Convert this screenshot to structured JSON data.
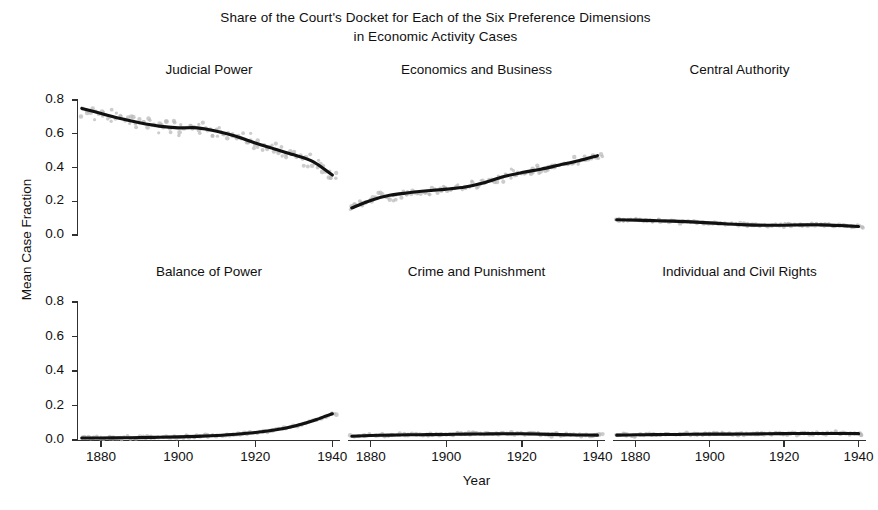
{
  "figure": {
    "title": "Share of the Court's Docket for Each of the Six Preference Dimensions\nin Economic Activity Cases",
    "xlabel": "Year",
    "ylabel": "Mean Case Fraction"
  },
  "chart_data": {
    "type": "line",
    "title": "Share of the Court's Docket for Each of the Six Preference Dimensions in Economic Activity Cases",
    "xlabel": "Year",
    "ylabel": "Mean Case Fraction",
    "grid": false,
    "legend": "none",
    "layout": "3 columns x 2 rows of small-multiple panels, shared axes",
    "xlim": [
      1874,
      1942
    ],
    "ylim": [
      0.0,
      0.88
    ],
    "xticks": [
      1880,
      1900,
      1920,
      1940
    ],
    "xtick_labels": [
      "1880",
      "1900",
      "1920",
      "1940"
    ],
    "yticks": [
      0.0,
      0.2,
      0.4,
      0.6,
      0.8
    ],
    "ytick_labels": [
      "0.0",
      "0.2",
      "0.4",
      "0.6",
      "0.8"
    ],
    "marker_style": "light grey scatter of yearly observations with heavy black smoothed trend line",
    "panels": [
      {
        "name": "Judicial Power",
        "row": 0,
        "col": 0,
        "x": [
          1875,
          1880,
          1885,
          1890,
          1895,
          1900,
          1905,
          1910,
          1915,
          1920,
          1925,
          1930,
          1935,
          1940
        ],
        "values": [
          0.75,
          0.72,
          0.69,
          0.665,
          0.645,
          0.635,
          0.635,
          0.615,
          0.585,
          0.545,
          0.51,
          0.475,
          0.435,
          0.355
        ]
      },
      {
        "name": "Economics and Business",
        "row": 0,
        "col": 1,
        "x": [
          1875,
          1880,
          1885,
          1890,
          1895,
          1900,
          1905,
          1910,
          1915,
          1920,
          1925,
          1930,
          1935,
          1940
        ],
        "values": [
          0.16,
          0.205,
          0.235,
          0.25,
          0.262,
          0.272,
          0.285,
          0.31,
          0.345,
          0.37,
          0.39,
          0.415,
          0.44,
          0.47
        ]
      },
      {
        "name": "Central Authority",
        "row": 0,
        "col": 2,
        "x": [
          1875,
          1880,
          1885,
          1890,
          1895,
          1900,
          1905,
          1910,
          1915,
          1920,
          1925,
          1930,
          1935,
          1940
        ],
        "values": [
          0.09,
          0.088,
          0.085,
          0.082,
          0.078,
          0.072,
          0.065,
          0.06,
          0.058,
          0.058,
          0.06,
          0.06,
          0.056,
          0.05
        ]
      },
      {
        "name": "Balance of Power",
        "row": 1,
        "col": 0,
        "x": [
          1875,
          1880,
          1885,
          1890,
          1895,
          1900,
          1905,
          1910,
          1915,
          1920,
          1925,
          1930,
          1935,
          1940
        ],
        "values": [
          0.012,
          0.012,
          0.013,
          0.014,
          0.016,
          0.018,
          0.021,
          0.026,
          0.033,
          0.043,
          0.058,
          0.08,
          0.112,
          0.152
        ]
      },
      {
        "name": "Crime and Punishment",
        "row": 1,
        "col": 1,
        "x": [
          1875,
          1880,
          1885,
          1890,
          1895,
          1900,
          1905,
          1910,
          1915,
          1920,
          1925,
          1930,
          1935,
          1940
        ],
        "values": [
          0.022,
          0.026,
          0.028,
          0.03,
          0.031,
          0.032,
          0.034,
          0.035,
          0.036,
          0.036,
          0.034,
          0.031,
          0.029,
          0.028
        ]
      },
      {
        "name": "Individual and Civil Rights",
        "row": 1,
        "col": 2,
        "x": [
          1875,
          1880,
          1885,
          1890,
          1895,
          1900,
          1905,
          1910,
          1915,
          1920,
          1925,
          1930,
          1935,
          1940
        ],
        "values": [
          0.028,
          0.03,
          0.031,
          0.032,
          0.033,
          0.034,
          0.034,
          0.035,
          0.036,
          0.037,
          0.038,
          0.038,
          0.038,
          0.037
        ]
      }
    ]
  }
}
